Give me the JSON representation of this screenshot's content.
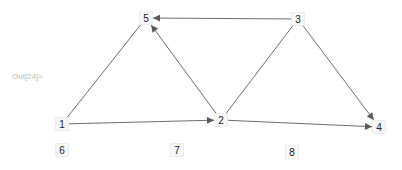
{
  "cell": {
    "output_label": "Out[24]="
  },
  "graph": {
    "edge_color": "#6e6e6e",
    "nodes": [
      {
        "id": "1",
        "label": "1",
        "x": 62,
        "y": 124
      },
      {
        "id": "2",
        "label": "2",
        "x": 221,
        "y": 120
      },
      {
        "id": "3",
        "label": "3",
        "x": 298,
        "y": 19
      },
      {
        "id": "4",
        "label": "4",
        "x": 379,
        "y": 127
      },
      {
        "id": "5",
        "label": "5",
        "x": 146,
        "y": 18
      },
      {
        "id": "6",
        "label": "6",
        "x": 62,
        "y": 150
      },
      {
        "id": "7",
        "label": "7",
        "x": 177,
        "y": 150
      },
      {
        "id": "8",
        "label": "8",
        "x": 292,
        "y": 152
      }
    ],
    "edges": [
      {
        "from": "3",
        "to": "5",
        "directed": true
      },
      {
        "from": "2",
        "to": "5",
        "directed": true
      },
      {
        "from": "1",
        "to": "5",
        "directed": false
      },
      {
        "from": "1",
        "to": "2",
        "directed": true
      },
      {
        "from": "2",
        "to": "3",
        "directed": false
      },
      {
        "from": "3",
        "to": "4",
        "directed": true
      },
      {
        "from": "2",
        "to": "4",
        "directed": true
      }
    ]
  }
}
